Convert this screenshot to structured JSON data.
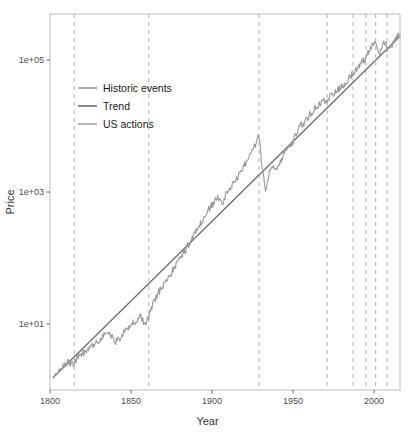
{
  "chart_data": {
    "type": "line",
    "title": "",
    "xlabel": "Year",
    "ylabel": "Price",
    "xlim": [
      1800,
      2016
    ],
    "ylim": [
      1,
      500000
    ],
    "yscale": "log",
    "grid": false,
    "legend_position": "top-left",
    "xticks": [
      1800,
      1850,
      1900,
      1950,
      2000
    ],
    "xticklabels": [
      "1800",
      "1850",
      "1900",
      "1950",
      "2000"
    ],
    "yticks": [
      10,
      1000,
      100000
    ],
    "yticklabels": [
      "1e+01",
      "1e+03",
      "1e+05"
    ],
    "legend": [
      {
        "label": "Historic events",
        "color": "#9a9a9a"
      },
      {
        "label": "Trend",
        "color": "#6e6e6e"
      },
      {
        "label": "US actions",
        "color": "#a8a8a8"
      }
    ],
    "annotations": {
      "vertical_dashed_lines_years": [
        1815,
        1861,
        1929,
        1971,
        1987,
        1995,
        2001,
        2008
      ],
      "vertical_dashed_color": "#b4b4b4"
    },
    "series": [
      {
        "name": "Trend",
        "color": "#6e6e6e",
        "type": "line",
        "x": [
          1802,
          2016
        ],
        "y": [
          1.55,
          230000
        ]
      },
      {
        "name": "Price",
        "color": "#9a9a9a",
        "type": "line",
        "x": [
          1802,
          1805,
          1808,
          1811,
          1814,
          1817,
          1820,
          1823,
          1826,
          1829,
          1832,
          1835,
          1838,
          1841,
          1844,
          1847,
          1850,
          1853,
          1856,
          1859,
          1862,
          1865,
          1868,
          1871,
          1874,
          1877,
          1880,
          1883,
          1886,
          1889,
          1892,
          1895,
          1898,
          1901,
          1904,
          1907,
          1910,
          1913,
          1916,
          1919,
          1922,
          1925,
          1928,
          1929,
          1931,
          1933,
          1935,
          1937,
          1940,
          1943,
          1946,
          1949,
          1952,
          1955,
          1958,
          1961,
          1964,
          1967,
          1970,
          1973,
          1976,
          1979,
          1982,
          1985,
          1988,
          1991,
          1994,
          1997,
          2000,
          2001,
          2003,
          2005,
          2007,
          2008,
          2010,
          2013,
          2016
        ],
        "y": [
          1.55,
          1.9,
          2.3,
          2.6,
          2.4,
          3.1,
          3.6,
          4.0,
          4.6,
          5.2,
          6.2,
          7.8,
          6.4,
          5.4,
          6.6,
          8.0,
          9.5,
          11.5,
          13.0,
          9.3,
          16.0,
          24.0,
          33.0,
          44.0,
          55.0,
          72.0,
          98.0,
          125.0,
          170.0,
          225.0,
          300.0,
          400.0,
          540.0,
          690.0,
          820.0,
          700.0,
          1150.0,
          1320.0,
          1750.0,
          2400.0,
          3000.0,
          4200.0,
          6400.0,
          7400.0,
          2300.0,
          1050.0,
          1800.0,
          2700.0,
          2300.0,
          3200.0,
          4600.0,
          5200.0,
          7800.0,
          10500.0,
          12000.0,
          15500.0,
          19500.0,
          22000.0,
          24000.0,
          28000.0,
          33000.0,
          38000.0,
          44000.0,
          56000.0,
          68000.0,
          82000.0,
          100000.0,
          135000.0,
          200000.0,
          175000.0,
          120000.0,
          160000.0,
          190000.0,
          135000.0,
          165000.0,
          200000.0,
          255000.0
        ]
      }
    ]
  },
  "axes": {
    "y_label": "Price",
    "x_label": "Year",
    "y_tick_labels": [
      "1e+05",
      "1e+03",
      "1e+01"
    ],
    "x_tick_labels": [
      "1800",
      "1850",
      "1900",
      "1950",
      "2000"
    ]
  },
  "legend": {
    "items": [
      {
        "label": "Historic events"
      },
      {
        "label": "Trend"
      },
      {
        "label": "US actions"
      }
    ]
  }
}
